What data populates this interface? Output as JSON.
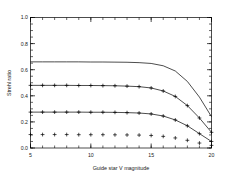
{
  "chart_data": {
    "type": "line",
    "title": "",
    "subtitle": "",
    "xlabel": "Guide star V magnitude",
    "ylabel": "Strehl ratio",
    "xlim": [
      5,
      20
    ],
    "ylim": [
      0.0,
      1.0
    ],
    "grid": false,
    "legend": "none",
    "xticks": [
      5,
      10,
      15,
      20
    ],
    "xtick_labels": [
      "5",
      "10",
      "15",
      "20"
    ],
    "yticks": [
      0.0,
      0.2,
      0.4,
      0.6,
      0.8,
      1.0
    ],
    "ytick_labels": [
      "0.0",
      "0.2",
      "0.4",
      "0.6",
      "0.8",
      "1.0"
    ],
    "x_minor_tick_interval": 1,
    "y_minor_tick_interval": 0.05,
    "marker": "plus",
    "line_color": "#000000",
    "marker_color": "#000000",
    "series": [
      {
        "name": "curve-1",
        "style": "line",
        "has_markers": false,
        "x": [
          5,
          6,
          7,
          8,
          9,
          10,
          11,
          12,
          13,
          14,
          15,
          16,
          17,
          18,
          19,
          20
        ],
        "values": [
          0.66,
          0.66,
          0.66,
          0.66,
          0.66,
          0.659,
          0.659,
          0.658,
          0.657,
          0.654,
          0.648,
          0.63,
          0.59,
          0.51,
          0.39,
          0.24
        ]
      },
      {
        "name": "curve-2",
        "style": "line+markers",
        "has_markers": true,
        "x": [
          5,
          6,
          7,
          8,
          9,
          10,
          11,
          12,
          13,
          14,
          15,
          16,
          17,
          18,
          19,
          20
        ],
        "values": [
          0.48,
          0.48,
          0.48,
          0.48,
          0.479,
          0.479,
          0.478,
          0.477,
          0.474,
          0.47,
          0.46,
          0.437,
          0.395,
          0.325,
          0.23,
          0.12
        ]
      },
      {
        "name": "curve-3",
        "style": "line+markers",
        "has_markers": true,
        "x": [
          5,
          6,
          7,
          8,
          9,
          10,
          11,
          12,
          13,
          14,
          15,
          16,
          17,
          18,
          19,
          20
        ],
        "values": [
          0.275,
          0.275,
          0.275,
          0.275,
          0.275,
          0.274,
          0.274,
          0.273,
          0.271,
          0.268,
          0.261,
          0.245,
          0.215,
          0.17,
          0.11,
          0.05
        ]
      },
      {
        "name": "curve-4",
        "style": "markers",
        "has_markers": true,
        "x": [
          5,
          6,
          7,
          8,
          9,
          10,
          11,
          12,
          13,
          14,
          15,
          16,
          17,
          18,
          19,
          20
        ],
        "values": [
          0.103,
          0.103,
          0.103,
          0.103,
          0.102,
          0.102,
          0.102,
          0.101,
          0.1,
          0.099,
          0.096,
          0.089,
          0.077,
          0.059,
          0.038,
          0.02
        ]
      }
    ]
  },
  "figure": {
    "background": "#ffffff",
    "axis_color": "#000000"
  }
}
